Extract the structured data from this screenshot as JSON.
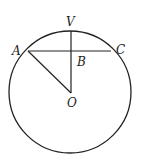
{
  "diagram": {
    "labels": {
      "V": "V",
      "A": "A",
      "B": "B",
      "C": "C",
      "O": "O"
    },
    "colors": {
      "stroke": "#222222",
      "background": "#ffffff"
    }
  }
}
